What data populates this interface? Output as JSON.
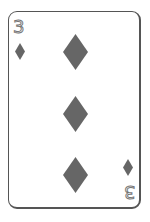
{
  "card": {
    "rank": "3",
    "suit": "diamonds",
    "suit_icon": "diamond-icon",
    "pip_count": 3,
    "colors": {
      "border": "#555555",
      "suit": "#666666",
      "rank_outline": "#777777",
      "background": "#ffffff"
    }
  }
}
